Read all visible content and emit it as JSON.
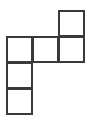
{
  "diagram": {
    "type": "cube-net",
    "line_color": "#3a3a3a",
    "background": "#ffffff",
    "cell_size": 27,
    "origin": {
      "x": 6,
      "y": 10
    },
    "cells": [
      {
        "row": 0,
        "col": 2
      },
      {
        "row": 1,
        "col": 0
      },
      {
        "row": 1,
        "col": 1
      },
      {
        "row": 1,
        "col": 2
      },
      {
        "row": 2,
        "col": 0
      },
      {
        "row": 3,
        "col": 0
      }
    ]
  }
}
